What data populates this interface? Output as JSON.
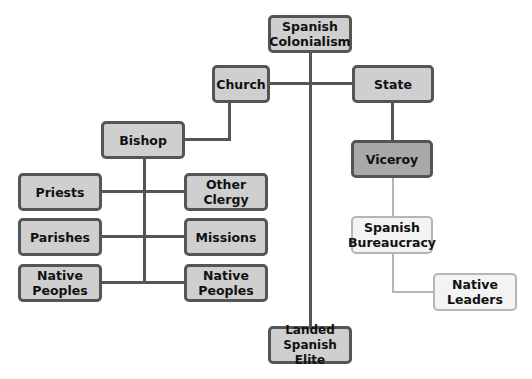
{
  "diagram": {
    "type": "hierarchy",
    "title": "",
    "nodes": [
      {
        "id": "spanish_colonialism",
        "label": "Spanish Colonialism"
      },
      {
        "id": "church",
        "label": "Church"
      },
      {
        "id": "state",
        "label": "State"
      },
      {
        "id": "bishop",
        "label": "Bishop"
      },
      {
        "id": "priests",
        "label": "Priests"
      },
      {
        "id": "other_clergy",
        "label": "Other Clergy"
      },
      {
        "id": "parishes",
        "label": "Parishes"
      },
      {
        "id": "missions",
        "label": "Missions"
      },
      {
        "id": "native_peoples_left",
        "label": "Native Peoples"
      },
      {
        "id": "native_peoples_right",
        "label": "Native Peoples"
      },
      {
        "id": "viceroy",
        "label": "Viceroy"
      },
      {
        "id": "spanish_bureaucracy",
        "label": "Spanish Bureaucracy"
      },
      {
        "id": "native_leaders",
        "label": "Native Leaders"
      },
      {
        "id": "landed_spanish_elite",
        "label": "Landed Spanish Elite"
      }
    ],
    "edges": [
      [
        "spanish_colonialism",
        "church"
      ],
      [
        "spanish_colonialism",
        "state"
      ],
      [
        "spanish_colonialism",
        "landed_spanish_elite"
      ],
      [
        "church",
        "bishop"
      ],
      [
        "bishop",
        "priests"
      ],
      [
        "bishop",
        "other_clergy"
      ],
      [
        "bishop",
        "parishes"
      ],
      [
        "bishop",
        "missions"
      ],
      [
        "bishop",
        "native_peoples_left"
      ],
      [
        "bishop",
        "native_peoples_right"
      ],
      [
        "state",
        "viceroy"
      ],
      [
        "viceroy",
        "spanish_bureaucracy"
      ],
      [
        "spanish_bureaucracy",
        "native_leaders"
      ]
    ],
    "colors": {
      "box_fill": "#cfcfcf",
      "viceroy_fill": "#a9a9a9",
      "light_fill": "#f3f3f3",
      "dark_line": "#555555",
      "light_line": "#b5b5b5"
    }
  }
}
